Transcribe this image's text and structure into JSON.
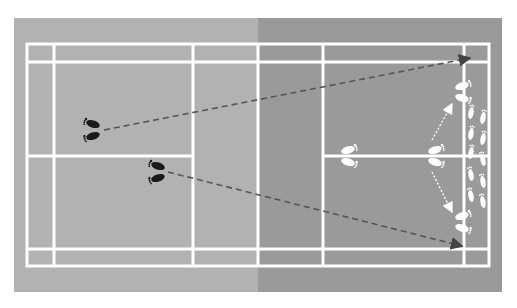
{
  "diagram": {
    "type": "badminton-court-footwork",
    "colors": {
      "background": "#ffffff",
      "surround_left": "#b2b2b2",
      "surround_right": "#9a9a9a",
      "court_left": "#b4b4b4",
      "court_right": "#9c9c9c",
      "lines": "#ffffff",
      "player_left_feet": "#1a1a1a",
      "player_right_feet": "#ffffff",
      "shot_arrow": "#555555",
      "movement_arrow": "#ffffff"
    },
    "court": {
      "outer": {
        "x1": 27,
        "y1": 44,
        "x2": 489,
        "y2": 266
      },
      "net_x": 258,
      "short_service_lines_x": [
        193,
        323
      ],
      "long_service_doubles_x": [
        54,
        464
      ],
      "side_singles_lines_y": [
        62,
        249
      ],
      "center_line_y": 156
    },
    "players": [
      {
        "name": "left-player-position-1",
        "color": "black",
        "x": 93,
        "y": 130
      },
      {
        "name": "left-player-position-2",
        "color": "black",
        "x": 158,
        "y": 172
      },
      {
        "name": "right-player-base-center",
        "color": "white",
        "x": 348,
        "y": 156
      },
      {
        "name": "right-player-pivot",
        "color": "white",
        "x": 434,
        "y": 156
      },
      {
        "name": "right-player-rear-top",
        "color": "white",
        "x": 462,
        "y": 92
      },
      {
        "name": "right-player-rear-bottom",
        "color": "white",
        "x": 462,
        "y": 222
      }
    ],
    "shots": [
      {
        "name": "clear-to-top-rear",
        "from": [
          104,
          130
        ],
        "to": [
          470,
          58
        ]
      },
      {
        "name": "clear-to-bottom-rear",
        "from": [
          168,
          172
        ],
        "to": [
          462,
          246
        ]
      }
    ],
    "movements": [
      {
        "name": "move-to-top-rear",
        "from": [
          432,
          140
        ],
        "to": [
          452,
          104
        ]
      },
      {
        "name": "move-to-bottom-rear",
        "from": [
          432,
          172
        ],
        "to": [
          452,
          212
        ]
      }
    ]
  }
}
